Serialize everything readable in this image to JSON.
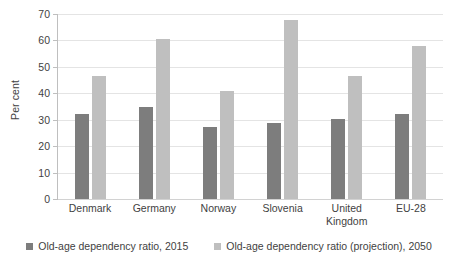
{
  "chart_data": {
    "type": "bar",
    "title": "",
    "subtitle": "",
    "xlabel": "",
    "ylabel": "Per cent",
    "ylim": [
      0,
      70
    ],
    "yticks": [
      0,
      10,
      20,
      30,
      40,
      50,
      60,
      70
    ],
    "ytick_labels": [
      "0",
      "10",
      "20",
      "30",
      "40",
      "50",
      "60",
      "70"
    ],
    "grid": true,
    "legend_position": "bottom",
    "categories": [
      "Denmark",
      "Germany",
      "Norway",
      "Slovenia",
      "United Kingdom",
      "EU-28"
    ],
    "category_labels": [
      [
        "Denmark"
      ],
      [
        "Germany"
      ],
      [
        "Norway"
      ],
      [
        "Slovenia"
      ],
      [
        "United",
        "Kingdom"
      ],
      [
        "EU-28"
      ]
    ],
    "series": [
      {
        "name": "Old-age dependency ratio, 2015",
        "color": "#7d7d7d",
        "values": [
          32.0,
          34.9,
          27.1,
          28.6,
          30.4,
          32.0
        ]
      },
      {
        "name": "Old-age dependency ratio (projection), 2050",
        "color": "#bfbfbf",
        "values": [
          46.5,
          60.5,
          41.0,
          67.6,
          46.5,
          58.0
        ]
      }
    ]
  },
  "legend": {
    "items": [
      {
        "label": "Old-age dependency ratio, 2015",
        "color": "#7d7d7d"
      },
      {
        "label": "Old-age dependency ratio (projection), 2050",
        "color": "#bfbfbf"
      }
    ]
  },
  "colors": {
    "background": "#ffffff",
    "gridline": "#e4e4e4",
    "axis": "#bfbfbf",
    "text": "#3f3f3f",
    "series_2015": "#7d7d7d",
    "series_2050": "#bfbfbf"
  }
}
